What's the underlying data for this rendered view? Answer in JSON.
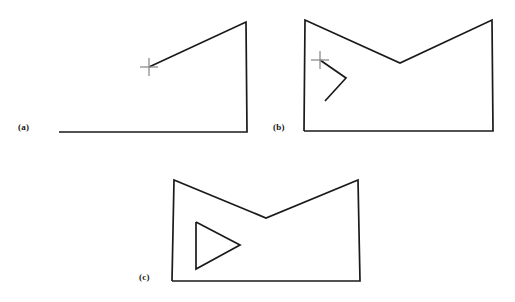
{
  "figure": {
    "background_color": "#ffffff",
    "line_color": "#1a1a1a",
    "cursor_color": "#8d8d8d",
    "width": 515,
    "height": 302,
    "panels": [
      {
        "id": "a",
        "label": "(a)",
        "label_x": 18,
        "label_y": 123,
        "description": "partial polygon: two edges drawn plus rubber-band segment to cursor",
        "polyline_points": "59,132 247,132 246,22 149,67",
        "closed": false,
        "cursor": {
          "name": "crosshair-cursor",
          "x": 149,
          "y": 67,
          "arm_length": 9
        },
        "inner_shape": null
      },
      {
        "id": "b",
        "label": "(b)",
        "label_x": 273,
        "label_y": 123,
        "description": "closed outer polygon with V-notch; inner hole partially drawn with rubber-band to cursor",
        "polyline_points": "304,131 493,131 492,20 400,63 305,20 304,131",
        "closed": true,
        "cursor": {
          "name": "crosshair-cursor",
          "x": 320,
          "y": 60,
          "arm_length": 9
        },
        "inner_shape": {
          "name": "inner-hole-partial",
          "points": "325,101 346,78 320,60",
          "closed": false
        }
      },
      {
        "id": "c",
        "label": "(c)",
        "label_x": 139,
        "label_y": 273,
        "description": "completed outer polygon with V-notch and closed triangular interior hole",
        "polyline_points": "172,281 360,281 358,180 266,218 174,180 172,281",
        "closed": true,
        "cursor": null,
        "inner_shape": {
          "name": "inner-hole-triangle",
          "points": "196,222 240,245 196,269 196,222",
          "closed": true
        }
      }
    ]
  }
}
